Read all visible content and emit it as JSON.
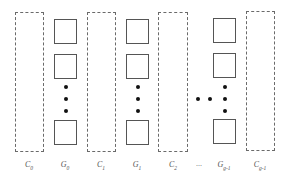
{
  "diagram": {
    "columns": [
      {
        "type": "C",
        "label": "C",
        "sub": "0",
        "x": 15,
        "width": 29
      },
      {
        "type": "G",
        "label": "G",
        "sub": "0",
        "x": 54,
        "width": 23
      },
      {
        "type": "C",
        "label": "C",
        "sub": "1",
        "x": 87,
        "width": 29
      },
      {
        "type": "G",
        "label": "G",
        "sub": "1",
        "x": 126,
        "width": 23
      },
      {
        "type": "C",
        "label": "C",
        "sub": "2",
        "x": 158,
        "width": 30
      },
      {
        "type": "G",
        "label": "G",
        "sub": "g-1",
        "x": 213,
        "width": 23
      },
      {
        "type": "C",
        "label": "C",
        "sub": "g-1",
        "x": 246,
        "width": 29
      }
    ],
    "ellipsis_label": "...",
    "labels": {
      "c0": "C",
      "c0_sub": "0",
      "g0": "G",
      "g0_sub": "0",
      "c1": "C",
      "c1_sub": "1",
      "g1": "G",
      "g1_sub": "1",
      "c2": "C",
      "c2_sub": "2",
      "ellipsis": "...",
      "gg1": "G",
      "gg1_sub": "g-1",
      "cg1": "C",
      "cg1_sub": "g-1"
    }
  }
}
